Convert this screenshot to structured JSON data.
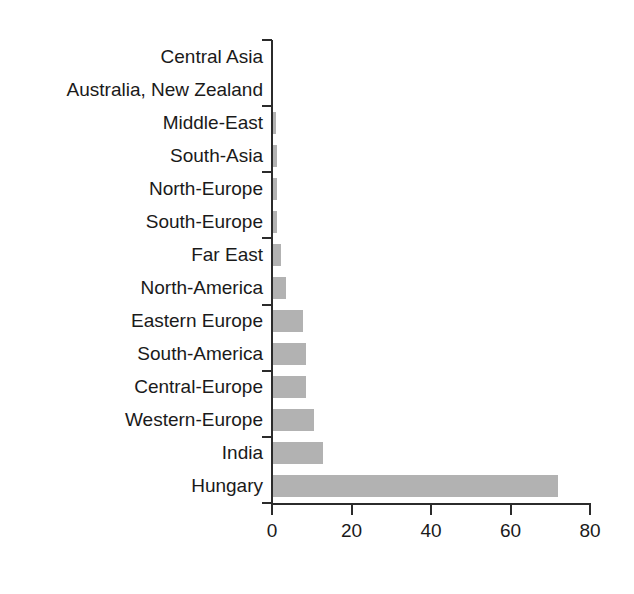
{
  "chart": {
    "background_color": "#ffffff",
    "bar_color": "#b2b2b2",
    "axis_color": "#2b2b2b",
    "text_color": "#1a1a1a"
  },
  "chart_data": {
    "type": "bar",
    "orientation": "horizontal",
    "title": "",
    "subtitle": "",
    "xlabel": "",
    "ylabel": "",
    "xlim": [
      0,
      80
    ],
    "ylim": null,
    "grid": false,
    "legend": null,
    "xticks": [
      0,
      20,
      40,
      60,
      80
    ],
    "xtick_labels": [
      "0",
      "20",
      "40",
      "60",
      "80"
    ],
    "categories": [
      "Central Asia",
      "Australia, New Zealand",
      "Middle-East",
      "South-Asia",
      "North-Europe",
      "South-Europe",
      "Far East",
      "North-America",
      "Eastern Europe",
      "South-America",
      "Central-Europe",
      "Western-Europe",
      "India",
      "Hungary"
    ],
    "values": [
      0,
      0,
      0.7,
      0.9,
      1.0,
      1.1,
      2.0,
      3.3,
      7.5,
      8.3,
      8.3,
      10.3,
      12.6,
      71.7
    ]
  }
}
